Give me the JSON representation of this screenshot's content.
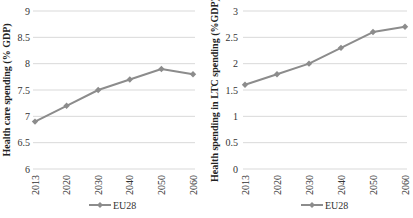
{
  "chart_data": [
    {
      "type": "line",
      "title": "",
      "xlabel": "",
      "ylabel": "Health care spending (% GDP)",
      "categories": [
        "2013",
        "2020",
        "2030",
        "2040",
        "2050",
        "2060"
      ],
      "series": [
        {
          "name": "EU28",
          "values": [
            6.9,
            7.2,
            7.5,
            7.7,
            7.9,
            7.8
          ],
          "color": "#8c8c8c",
          "marker": "diamond"
        }
      ],
      "ylim": [
        6,
        9
      ],
      "yticks": [
        "6",
        "6.5",
        "7",
        "7.5",
        "8",
        "8.5",
        "9"
      ],
      "grid": true,
      "legend_position": "bottom"
    },
    {
      "type": "line",
      "title": "",
      "xlabel": "",
      "ylabel": "Health spending in LTC spending (%GDP)",
      "categories": [
        "2013",
        "2020",
        "2030",
        "2040",
        "2050",
        "2060"
      ],
      "series": [
        {
          "name": "EU28",
          "values": [
            1.6,
            1.8,
            2.0,
            2.3,
            2.6,
            2.7
          ],
          "color": "#8c8c8c",
          "marker": "diamond"
        }
      ],
      "ylim": [
        0,
        3
      ],
      "yticks": [
        "0",
        "0.5",
        "1",
        "1.5",
        "2",
        "2.5",
        "3"
      ],
      "grid": true,
      "legend_position": "bottom"
    }
  ],
  "colors": {
    "series": "#8c8c8c",
    "grid": "#d9d9d9",
    "text": "#333333"
  }
}
